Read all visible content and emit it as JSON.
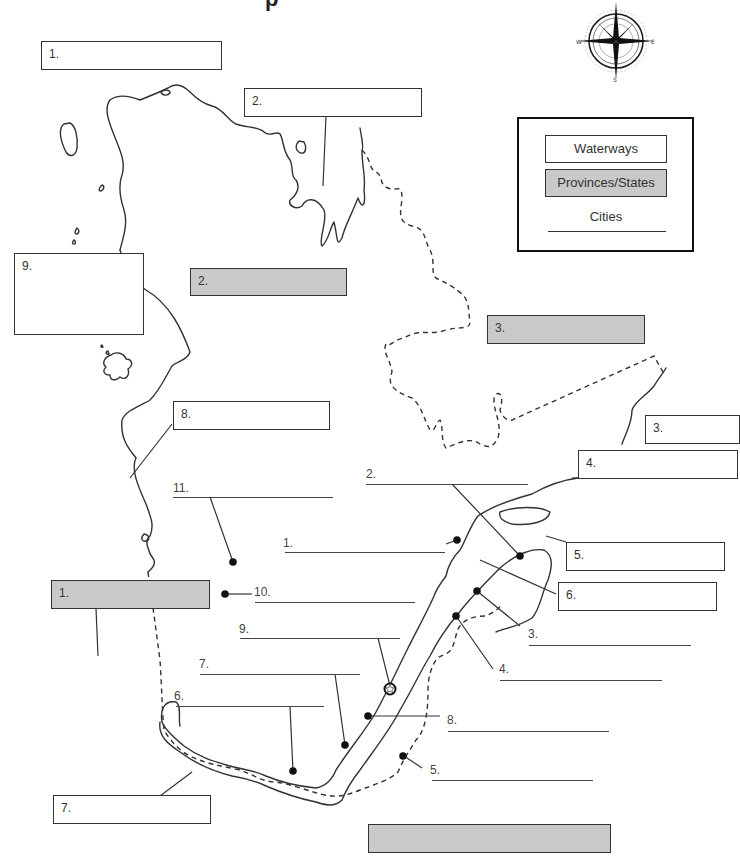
{
  "title_fragment": "p",
  "legend": {
    "waterways_label": "Waterways",
    "provinces_label": "Provinces/States",
    "cities_label": "Cities"
  },
  "compass": {
    "north": "N",
    "south": "S",
    "east": "E",
    "west": "W"
  },
  "waterway_boxes": [
    {
      "label": "1.",
      "value": ""
    },
    {
      "label": "2.",
      "value": ""
    },
    {
      "label": "9.",
      "value": ""
    },
    {
      "label": "8.",
      "value": ""
    },
    {
      "label": "3.",
      "value": ""
    },
    {
      "label": "4.",
      "value": ""
    },
    {
      "label": "5.",
      "value": ""
    },
    {
      "label": "6.",
      "value": ""
    },
    {
      "label": "7.",
      "value": ""
    }
  ],
  "province_boxes": [
    {
      "label": "2.",
      "value": ""
    },
    {
      "label": "3.",
      "value": ""
    },
    {
      "label": "1.",
      "value": ""
    },
    {
      "label": "",
      "value": ""
    }
  ],
  "city_blanks": [
    {
      "label": "11.",
      "value": ""
    },
    {
      "label": "2.",
      "value": ""
    },
    {
      "label": "1.",
      "value": ""
    },
    {
      "label": "10.",
      "value": ""
    },
    {
      "label": "9.",
      "value": ""
    },
    {
      "label": "7.",
      "value": ""
    },
    {
      "label": "6.",
      "value": ""
    },
    {
      "label": "3.",
      "value": ""
    },
    {
      "label": "4.",
      "value": ""
    },
    {
      "label": "8.",
      "value": ""
    },
    {
      "label": "5.",
      "value": ""
    }
  ],
  "colors": {
    "province_fill": "#c9c9c9",
    "outline": "#333333"
  }
}
